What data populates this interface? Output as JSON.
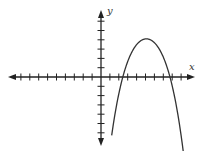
{
  "chart_data": {
    "type": "line",
    "title": "",
    "xlabel": "x",
    "ylabel": "y",
    "xlim": [
      -10,
      10
    ],
    "ylim": [
      -7,
      7
    ],
    "grid": false,
    "legend": null,
    "x_ticks": [
      -9,
      -8,
      -7,
      -6,
      -5,
      -4,
      -3,
      -2,
      -1,
      1,
      2,
      3,
      4,
      5,
      6,
      7,
      8,
      9
    ],
    "y_ticks": [
      -6,
      -5,
      -4,
      -3,
      -2,
      -1,
      1,
      2,
      3,
      4,
      5,
      6
    ],
    "tick_labels_shown": false,
    "series": [
      {
        "name": "parabola",
        "description": "downward-opening parabola, vertex approx (5, 4), x-intercepts approx 2.2 and 7.9",
        "x": [
          1.2,
          2.2,
          3,
          4,
          5,
          6,
          7,
          7.9,
          9.3
        ],
        "y": [
          -6.3,
          0,
          2.0,
          3.5,
          4,
          3.5,
          2.0,
          0,
          -6.3
        ]
      }
    ]
  },
  "axes": {
    "x_label": "x",
    "y_label": "y"
  },
  "colors": {
    "axis": "#222222",
    "curve": "#333333"
  }
}
